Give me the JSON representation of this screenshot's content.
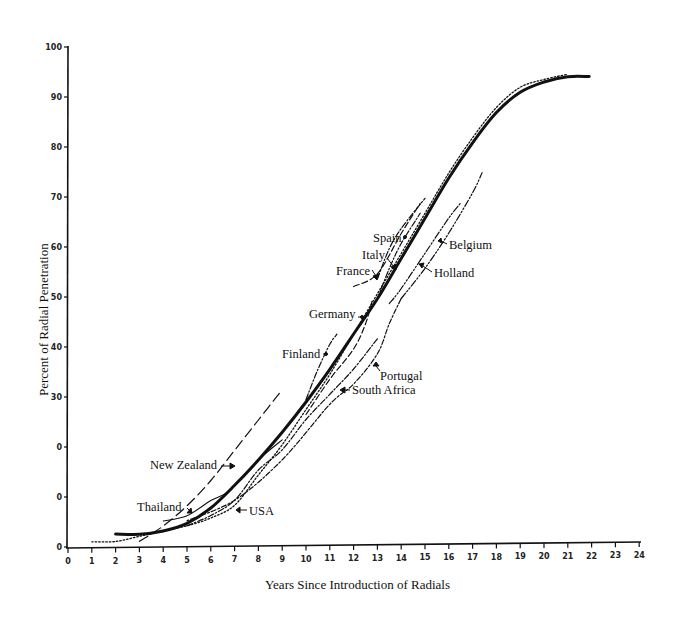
{
  "chart_data": {
    "type": "line",
    "title": "",
    "xlabel": "Years Since Introduction of Radials",
    "ylabel": "Percent of Radial Penetration",
    "xlim": [
      0,
      24
    ],
    "ylim": [
      0,
      100
    ],
    "grid": false,
    "legend": "none (series labeled by inline annotations with arrows)",
    "x_ticks": [
      0,
      1,
      2,
      3,
      4,
      5,
      6,
      7,
      8,
      9,
      10,
      11,
      12,
      13,
      14,
      15,
      16,
      17,
      18,
      19,
      20,
      21,
      22,
      23,
      24
    ],
    "y_ticks": [
      {
        "value": 0,
        "label": "0"
      },
      {
        "value": 10,
        "label": "0"
      },
      {
        "value": 20,
        "label": "0"
      },
      {
        "value": 30,
        "label": "30"
      },
      {
        "value": 40,
        "label": "40"
      },
      {
        "value": 50,
        "label": "50"
      },
      {
        "value": 60,
        "label": "60"
      },
      {
        "value": 70,
        "label": "70"
      },
      {
        "value": 80,
        "label": "80"
      },
      {
        "value": 90,
        "label": "90"
      },
      {
        "value": 100,
        "label": "100"
      }
    ],
    "series": [
      {
        "name": "Composite curve",
        "style": "solid-bold",
        "points": [
          [
            2,
            2.5
          ],
          [
            3,
            2.4
          ],
          [
            4,
            3
          ],
          [
            5,
            4.5
          ],
          [
            6,
            7.5
          ],
          [
            7,
            12
          ],
          [
            8,
            17
          ],
          [
            9,
            22.5
          ],
          [
            10,
            28.5
          ],
          [
            11,
            35
          ],
          [
            12,
            42
          ],
          [
            13,
            49
          ],
          [
            14,
            57
          ],
          [
            15,
            65
          ],
          [
            16,
            73
          ],
          [
            17,
            80
          ],
          [
            18,
            86
          ],
          [
            19,
            90
          ],
          [
            20,
            92
          ],
          [
            21,
            93
          ],
          [
            21.9,
            93
          ]
        ]
      },
      {
        "name": "USA",
        "style": "dotted",
        "points": [
          [
            1,
            1
          ],
          [
            2,
            1
          ],
          [
            3,
            2
          ],
          [
            4,
            3
          ],
          [
            5,
            4
          ],
          [
            6,
            5.5
          ],
          [
            7,
            8
          ],
          [
            8,
            14
          ],
          [
            9,
            20
          ],
          [
            10,
            27
          ],
          [
            11,
            34
          ],
          [
            12,
            42
          ],
          [
            13,
            50
          ],
          [
            14,
            58
          ],
          [
            15,
            66
          ],
          [
            16,
            74
          ],
          [
            17,
            81
          ],
          [
            18,
            87
          ],
          [
            19,
            91
          ],
          [
            20,
            92.5
          ],
          [
            21,
            93.5
          ]
        ]
      },
      {
        "name": "Thailand",
        "style": "solid-thin",
        "points": [
          [
            4,
            5
          ],
          [
            5,
            6
          ],
          [
            6,
            9
          ],
          [
            6.8,
            11
          ],
          [
            8,
            17
          ],
          [
            9,
            21
          ]
        ]
      },
      {
        "name": "New Zealand",
        "style": "long-dash",
        "points": [
          [
            3,
            1
          ],
          [
            4,
            4
          ],
          [
            5,
            8
          ],
          [
            6,
            13
          ],
          [
            7,
            19
          ],
          [
            8,
            25
          ],
          [
            9,
            31
          ]
        ]
      },
      {
        "name": "South Africa",
        "style": "dash-dot",
        "points": [
          [
            5,
            4
          ],
          [
            6,
            6
          ],
          [
            7,
            9
          ],
          [
            8,
            15
          ],
          [
            9,
            19
          ],
          [
            10,
            25
          ],
          [
            11,
            30
          ],
          [
            12,
            35
          ],
          [
            13,
            41
          ]
        ]
      },
      {
        "name": "Portugal",
        "style": "dot-dash",
        "points": [
          [
            5,
            5
          ],
          [
            7,
            9
          ],
          [
            9,
            17
          ],
          [
            11,
            28
          ],
          [
            12,
            32
          ],
          [
            13,
            38
          ],
          [
            13.5,
            44
          ],
          [
            14,
            49
          ]
        ]
      },
      {
        "name": "Finland",
        "style": "dash-dot",
        "points": [
          [
            10,
            29
          ],
          [
            10.5,
            35
          ],
          [
            11,
            40
          ],
          [
            11.3,
            42
          ]
        ]
      },
      {
        "name": "Germany",
        "style": "dashed",
        "points": [
          [
            10,
            26
          ],
          [
            11,
            33
          ],
          [
            12,
            39
          ],
          [
            12.5,
            44
          ],
          [
            12.8,
            49
          ]
        ]
      },
      {
        "name": "France",
        "style": "dashed",
        "points": [
          [
            12,
            51.5
          ],
          [
            13,
            54
          ],
          [
            14,
            62
          ],
          [
            14.8,
            68
          ]
        ]
      },
      {
        "name": "Italy",
        "style": "dash-dot",
        "points": [
          [
            13,
            49
          ],
          [
            13.5,
            55
          ],
          [
            14,
            60
          ],
          [
            14.8,
            66
          ]
        ]
      },
      {
        "name": "Spain",
        "style": "dash-dot",
        "points": [
          [
            13,
            53
          ],
          [
            13.5,
            59
          ],
          [
            14,
            63
          ],
          [
            15,
            69
          ]
        ]
      },
      {
        "name": "Holland",
        "style": "dash-dot-dot",
        "points": [
          [
            13.5,
            48
          ],
          [
            14,
            51
          ],
          [
            15,
            58
          ],
          [
            16,
            65
          ],
          [
            16.5,
            68
          ]
        ]
      },
      {
        "name": "Belgium",
        "style": "dash-dot-dot",
        "points": [
          [
            14,
            49
          ],
          [
            15,
            55
          ],
          [
            16,
            62
          ],
          [
            17,
            70
          ],
          [
            17.4,
            74
          ]
        ]
      }
    ],
    "annotations": [
      {
        "text": "New Zealand",
        "x": 6.5,
        "y": 17
      },
      {
        "text": "Thailand",
        "x": 5.2,
        "y": 7.5
      },
      {
        "text": "USA",
        "x": 7.4,
        "y": 6.5
      },
      {
        "text": "Finland",
        "x": 11.3,
        "y": 38.5
      },
      {
        "text": "South Africa",
        "x": 12.8,
        "y": 31.5
      },
      {
        "text": "Portugal",
        "x": 13.2,
        "y": 34
      },
      {
        "text": "Germany",
        "x": 12.5,
        "y": 46
      },
      {
        "text": "France",
        "x": 12.8,
        "y": 55
      },
      {
        "text": "Italy",
        "x": 13.2,
        "y": 58
      },
      {
        "text": "Spain",
        "x": 13.5,
        "y": 61.5
      },
      {
        "text": "Holland",
        "x": 15.3,
        "y": 55.5
      },
      {
        "text": "Belgium",
        "x": 15.8,
        "y": 60.5
      }
    ]
  },
  "axes": {
    "x_title": "Years Since Introduction of Radials",
    "y_title": "Percent of Radial Penetration"
  },
  "labels": {
    "new_zealand": "New Zealand",
    "thailand": "Thailand",
    "usa": "USA",
    "finland": "Finland",
    "south_africa": "South Africa",
    "portugal": "Portugal",
    "germany": "Germany",
    "france": "France",
    "italy": "Italy",
    "spain": "Spain",
    "holland": "Holland",
    "belgium": "Belgium"
  },
  "ticks": {
    "x": [
      "0",
      "1",
      "2",
      "3",
      "4",
      "5",
      "6",
      "7",
      "8",
      "9",
      "10",
      "11",
      "12",
      "13",
      "14",
      "15",
      "16",
      "17",
      "18",
      "19",
      "20",
      "21",
      "22",
      "23",
      "24"
    ],
    "y": [
      "0",
      "0",
      "0",
      "30",
      "40",
      "50",
      "60",
      "70",
      "80",
      "90",
      "100"
    ]
  }
}
